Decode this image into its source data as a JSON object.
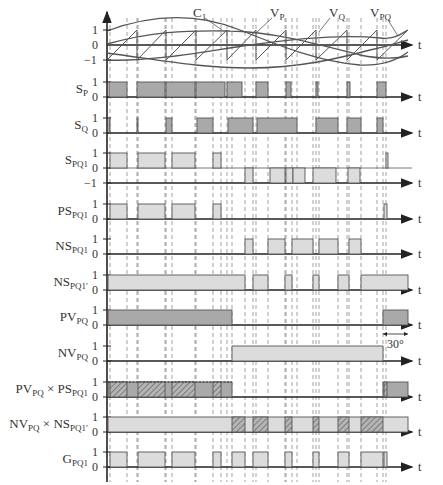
{
  "figure": {
    "type": "timing-diagram",
    "time_axis_label": "t",
    "angle_annotation": "30°",
    "colors": {
      "axis": "#222222",
      "pulse_dark_fill": "#a9a9a9",
      "pulse_light_fill": "#dcdcdc",
      "pulse_stroke": "#555555",
      "dashed_guides": "#666666",
      "hatch": "#555555"
    }
  },
  "carrier_panel": {
    "y_ticks": [
      "1",
      "0",
      "−1"
    ],
    "annotations": [
      {
        "label": "C",
        "sub": "1"
      },
      {
        "label": "V",
        "sub": "P"
      },
      {
        "label": "V",
        "sub": "Q"
      },
      {
        "label": "V",
        "sub": "PQ"
      }
    ]
  },
  "rows": [
    {
      "id": "sp",
      "label": "S",
      "sub": "P",
      "suffix": "",
      "ticks": [
        "1",
        "0"
      ],
      "fill": "dark"
    },
    {
      "id": "sq",
      "label": "S",
      "sub": "Q",
      "suffix": "",
      "ticks": [
        "1",
        "0"
      ],
      "fill": "dark"
    },
    {
      "id": "spq1",
      "label": "S",
      "sub": "PQ1",
      "suffix": "",
      "ticks": [
        "1",
        "0",
        "−1"
      ],
      "fill": "light"
    },
    {
      "id": "pspq1",
      "label": "PS",
      "sub": "PQ1",
      "suffix": "",
      "ticks": [
        "1",
        "0"
      ],
      "fill": "light"
    },
    {
      "id": "nspq1",
      "label": "NS",
      "sub": "PQ1",
      "suffix": "",
      "ticks": [
        "1",
        "0"
      ],
      "fill": "light"
    },
    {
      "id": "nspq1p",
      "label": "NS",
      "sub": "PQ1′",
      "suffix": "",
      "ticks": [
        "1",
        "0"
      ],
      "fill": "light"
    },
    {
      "id": "pvpq",
      "label": "PV",
      "sub": "PQ",
      "suffix": "",
      "ticks": [
        "1",
        "0"
      ],
      "fill": "dark"
    },
    {
      "id": "nvpq",
      "label": "NV",
      "sub": "PQ",
      "suffix": "",
      "ticks": [
        "1",
        "0"
      ],
      "fill": "light"
    },
    {
      "id": "pvxps",
      "label": "PV",
      "sub": "PQ",
      "suffix": " × PS",
      "sub2": "PQ1",
      "ticks": [
        "1",
        "0"
      ],
      "fill": "dark"
    },
    {
      "id": "nvxns",
      "label": "NV",
      "sub": "PQ",
      "suffix": " × NS",
      "sub2": "PQ1′",
      "ticks": [
        "1",
        "0"
      ],
      "fill": "light"
    },
    {
      "id": "gpq1",
      "label": "G",
      "sub": "PQ1",
      "suffix": "",
      "ticks": [
        "1",
        "0"
      ],
      "fill": "light"
    }
  ],
  "pulses": {
    "sp": [
      [
        109,
        127
      ],
      [
        137,
        165
      ],
      [
        166,
        195
      ],
      [
        196,
        225
      ],
      [
        227,
        242
      ],
      [
        256,
        268
      ],
      [
        286,
        291
      ],
      [
        316,
        318
      ],
      [
        347,
        350
      ],
      [
        377,
        386
      ]
    ],
    "sq": [
      [
        109,
        110
      ],
      [
        137,
        138
      ],
      [
        166,
        172
      ],
      [
        197,
        213
      ],
      [
        228,
        253
      ],
      [
        257,
        297
      ],
      [
        316,
        338
      ],
      [
        347,
        361
      ],
      [
        377,
        383
      ]
    ],
    "spq1_pos": [
      [
        110,
        127
      ],
      [
        138,
        165
      ],
      [
        172,
        195
      ],
      [
        213,
        221
      ],
      [
        386,
        388
      ]
    ],
    "spq1_neg": [
      [
        245,
        253
      ],
      [
        270,
        285
      ],
      [
        286,
        293
      ],
      [
        293,
        305
      ],
      [
        313,
        336
      ],
      [
        348,
        360
      ]
    ],
    "pspq1": [
      [
        110,
        127
      ],
      [
        138,
        165
      ],
      [
        172,
        195
      ],
      [
        213,
        221
      ],
      [
        384,
        387
      ]
    ],
    "nspq1": [
      [
        245,
        253
      ],
      [
        268,
        285
      ],
      [
        292,
        313
      ],
      [
        319,
        338
      ],
      [
        349,
        361
      ]
    ],
    "nspq1p": [
      [
        108,
        245
      ],
      [
        253,
        268
      ],
      [
        285,
        292
      ],
      [
        313,
        319
      ],
      [
        338,
        349
      ],
      [
        361,
        408
      ]
    ],
    "pvpq": [
      [
        108,
        232
      ],
      [
        383,
        408
      ]
    ],
    "nvpq": [
      [
        232,
        383
      ]
    ],
    "pvxps_base": [
      [
        108,
        232
      ],
      [
        383,
        408
      ]
    ],
    "pvxps_hatch": [
      [
        110,
        127
      ],
      [
        138,
        165
      ],
      [
        172,
        195
      ],
      [
        213,
        221
      ],
      [
        384,
        387
      ]
    ],
    "nvxns_base": [
      [
        108,
        408
      ]
    ],
    "nvxns_hatch": [
      [
        232,
        245
      ],
      [
        253,
        268
      ],
      [
        285,
        292
      ],
      [
        313,
        319
      ],
      [
        338,
        349
      ],
      [
        361,
        383
      ]
    ],
    "gpq1": [
      [
        110,
        127
      ],
      [
        138,
        165
      ],
      [
        172,
        195
      ],
      [
        213,
        221
      ],
      [
        232,
        245
      ],
      [
        253,
        268
      ],
      [
        285,
        292
      ],
      [
        313,
        319
      ],
      [
        338,
        349
      ],
      [
        361,
        383
      ],
      [
        384,
        387
      ]
    ]
  },
  "guide_lines_x": [
    110,
    127,
    137,
    138,
    165,
    166,
    172,
    195,
    196,
    213,
    221,
    227,
    232,
    245,
    253,
    256,
    268,
    285,
    286,
    292,
    297,
    313,
    316,
    319,
    338,
    347,
    349,
    361,
    377,
    383,
    386
  ]
}
